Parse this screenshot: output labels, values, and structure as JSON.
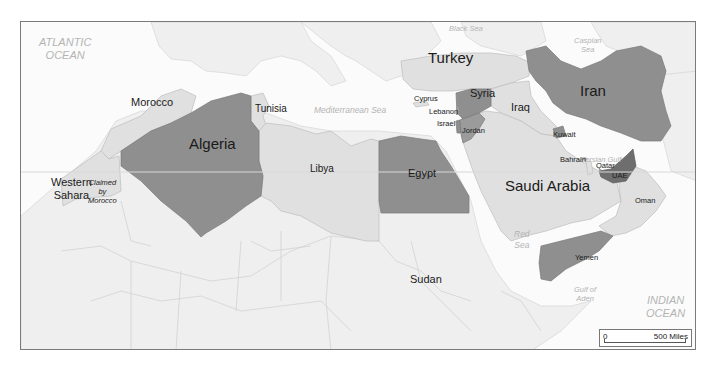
{
  "map": {
    "colors": {
      "water": "#fbfbfb",
      "land_background": "#efefef",
      "highlight_dark": "#8f8f8f",
      "highlight_darker": "#6e6e6e",
      "highlight_light": "#e0e0e0",
      "border": "#7a7a7a"
    },
    "water_labels": {
      "atlantic": [
        "ATLANTIC",
        "OCEAN"
      ],
      "mediterranean": "Mediterranean Sea",
      "black_sea": "Black Sea",
      "caspian": [
        "Caspian",
        "Sea"
      ],
      "red_sea": [
        "Red",
        "Sea"
      ],
      "persian_gulf": "Persian Gulf",
      "gulf_of_aden": [
        "Gulf of",
        "Aden"
      ],
      "indian": [
        "INDIAN",
        "OCEAN"
      ]
    },
    "countries": {
      "morocco": "Morocco",
      "western_sahara": [
        "Western",
        "Sahara"
      ],
      "claimed": [
        "Claimed",
        "by",
        "Morocco"
      ],
      "algeria": "Algeria",
      "tunisia": "Tunisia",
      "libya": "Libya",
      "egypt": "Egypt",
      "sudan": "Sudan",
      "turkey": "Turkey",
      "cyprus": "Cyprus",
      "lebanon": "Lebanon",
      "israel": "Israel",
      "jordan": "Jordan",
      "syria": "Syria",
      "iraq": "Iraq",
      "iran": "Iran",
      "kuwait": "Kuwait",
      "bahrain": "Bahrain",
      "qatar": "Qatar",
      "uae": "UAE",
      "saudi_arabia": "Saudi Arabia",
      "oman": "Oman",
      "yemen": "Yemen"
    },
    "scale_bar": {
      "start": "0",
      "end": "500 Miles"
    }
  }
}
